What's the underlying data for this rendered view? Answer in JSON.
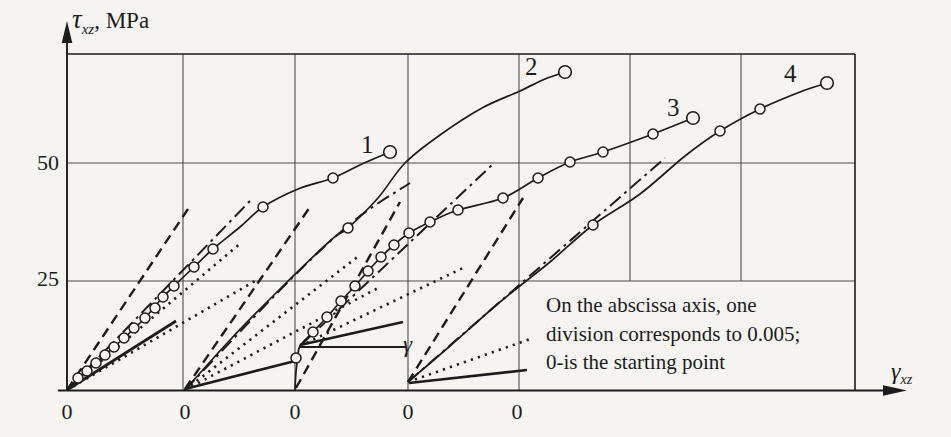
{
  "meta": {
    "bg": "#f5f4f1",
    "ink": "#1c1c1c",
    "grid_color": "#4d4d4d"
  },
  "axis": {
    "y_label": {
      "symbol": "τ",
      "sub": "xz",
      "suffix": ", MPa"
    },
    "x_label": {
      "symbol": "γ",
      "sub": "xz"
    },
    "y_ticks": [
      {
        "label": "50",
        "y": 163
      },
      {
        "label": "25",
        "y": 280
      }
    ],
    "zero_labels": [
      {
        "label": "0",
        "x": 67
      },
      {
        "label": "0",
        "x": 185
      },
      {
        "label": "0",
        "x": 295
      },
      {
        "label": "0",
        "x": 408
      },
      {
        "label": "0",
        "x": 517
      }
    ]
  },
  "frame": {
    "left": 67,
    "right": 855,
    "top": 54,
    "bottom": 390,
    "grid_vertical_full": [
      183,
      295,
      408,
      519
    ],
    "grid_vertical_partial": [
      {
        "x": 630,
        "y1": 54,
        "y2": 281
      },
      {
        "x": 741,
        "y1": 54,
        "y2": 281
      }
    ],
    "grid_horizontal": [
      163,
      281
    ],
    "x_axis_end": 886,
    "x_arrow_tip": 907,
    "y_axis_end": 40,
    "y_arrow_tip": 21
  },
  "gamma_marker": {
    "label": "γ"
  },
  "annotation": {
    "lines": [
      "On the abscissa axis, one",
      "division corresponds to 0.005;",
      "0-is the starting point"
    ]
  },
  "curve_labels": [
    {
      "text": "1",
      "x": 361,
      "y": 133
    },
    {
      "text": "2",
      "x": 525,
      "y": 55
    },
    {
      "text": "3",
      "x": 667,
      "y": 96
    },
    {
      "text": "4",
      "x": 784,
      "y": 62
    }
  ],
  "chart_data": {
    "type": "line",
    "title": "",
    "xlabel": "γxz (shear strain; one abscissa division = 0.005, each curve starts at its own 0)",
    "ylabel": "τxz, MPa",
    "ylim": [
      0,
      75
    ],
    "x_division_value": 0.005,
    "x_division_px": 112.3,
    "y_px_per_mpa": 4.52,
    "series": [
      {
        "name": "1",
        "origin_px": [
          67,
          390
        ],
        "path_px": [
          [
            67,
            390
          ],
          [
            87,
            371
          ],
          [
            105,
            355
          ],
          [
            124,
            338
          ],
          [
            145,
            318
          ],
          [
            163,
            297
          ],
          [
            174,
            286
          ],
          [
            194,
            267
          ],
          [
            213,
            249
          ],
          [
            240,
            227
          ],
          [
            263,
            207
          ],
          [
            298,
            189
          ],
          [
            333,
            178
          ],
          [
            362,
            164
          ],
          [
            390,
            152
          ]
        ],
        "markers_px": [
          [
            78,
            378
          ],
          [
            87,
            371
          ],
          [
            96,
            363
          ],
          [
            105,
            355
          ],
          [
            114,
            347
          ],
          [
            124,
            338
          ],
          [
            134,
            328
          ],
          [
            145,
            318
          ],
          [
            155,
            308
          ],
          [
            163,
            297
          ],
          [
            174,
            286
          ],
          [
            194,
            267
          ],
          [
            213,
            249
          ],
          [
            263,
            207
          ],
          [
            333,
            178
          ]
        ],
        "end_marker_px": [
          390,
          152
        ],
        "values_strain_stress": [
          [
            0,
            0
          ],
          [
            0.0009,
            4.2
          ],
          [
            0.0017,
            7.7
          ],
          [
            0.0025,
            11.5
          ],
          [
            0.0035,
            15.9
          ],
          [
            0.0043,
            20.6
          ],
          [
            0.0048,
            23.0
          ],
          [
            0.0057,
            27.2
          ],
          [
            0.0065,
            31.2
          ],
          [
            0.0077,
            36.1
          ],
          [
            0.0087,
            40.5
          ],
          [
            0.0103,
            44.5
          ],
          [
            0.0118,
            46.9
          ],
          [
            0.0131,
            50.0
          ],
          [
            0.0144,
            52.7
          ]
        ]
      },
      {
        "name": "2",
        "origin_px": [
          185,
          390
        ],
        "path_px": [
          [
            185,
            390
          ],
          [
            230,
            340
          ],
          [
            280,
            289
          ],
          [
            330,
            241
          ],
          [
            348,
            228
          ],
          [
            378,
            198
          ],
          [
            405,
            163
          ],
          [
            440,
            135
          ],
          [
            482,
            108
          ],
          [
            520,
            91
          ],
          [
            545,
            79
          ],
          [
            565,
            72
          ]
        ],
        "markers_px": [
          [
            348,
            228
          ]
        ],
        "end_marker_px": [
          565,
          72
        ],
        "values_strain_stress": [
          [
            0,
            0
          ],
          [
            0.002,
            11.1
          ],
          [
            0.0042,
            22.3
          ],
          [
            0.0065,
            33.0
          ],
          [
            0.0073,
            35.8
          ],
          [
            0.0086,
            42.5
          ],
          [
            0.0098,
            50.2
          ],
          [
            0.0114,
            56.4
          ],
          [
            0.0132,
            62.4
          ],
          [
            0.0149,
            66.2
          ],
          [
            0.016,
            68.8
          ],
          [
            0.0169,
            70.4
          ]
        ]
      },
      {
        "name": "3",
        "origin_px": [
          295,
          390
        ],
        "path_px": [
          [
            295,
            390
          ],
          [
            296,
            372
          ],
          [
            298,
            356
          ],
          [
            300,
            346
          ],
          [
            313,
            332
          ],
          [
            327,
            317
          ],
          [
            341,
            301
          ],
          [
            355,
            286
          ],
          [
            368,
            271
          ],
          [
            381,
            257
          ],
          [
            394,
            245
          ],
          [
            409,
            233
          ],
          [
            430,
            222
          ],
          [
            458,
            210
          ],
          [
            503,
            198
          ],
          [
            538,
            178
          ],
          [
            570,
            162
          ],
          [
            603,
            152
          ],
          [
            653,
            134
          ],
          [
            693,
            118
          ]
        ],
        "markers_px": [
          [
            296,
            358
          ],
          [
            313,
            332
          ],
          [
            327,
            317
          ],
          [
            341,
            301
          ],
          [
            355,
            286
          ],
          [
            368,
            271
          ],
          [
            381,
            257
          ],
          [
            394,
            245
          ],
          [
            409,
            233
          ],
          [
            430,
            222
          ],
          [
            458,
            210
          ],
          [
            503,
            198
          ],
          [
            538,
            178
          ],
          [
            570,
            162
          ],
          [
            603,
            152
          ],
          [
            653,
            134
          ]
        ],
        "end_marker_px": [
          693,
          118
        ],
        "values_strain_stress": [
          [
            0,
            0
          ],
          [
            0,
            4.0
          ],
          [
            0.0001,
            7.5
          ],
          [
            0.0002,
            9.7
          ],
          [
            0.0008,
            12.8
          ],
          [
            0.0014,
            16.2
          ],
          [
            0.002,
            19.7
          ],
          [
            0.0027,
            23.0
          ],
          [
            0.0033,
            26.3
          ],
          [
            0.0038,
            29.4
          ],
          [
            0.0044,
            32.1
          ],
          [
            0.0051,
            34.7
          ],
          [
            0.006,
            37.2
          ],
          [
            0.0073,
            39.8
          ],
          [
            0.0093,
            42.5
          ],
          [
            0.0108,
            46.9
          ],
          [
            0.0122,
            50.4
          ],
          [
            0.0137,
            52.7
          ],
          [
            0.0159,
            56.6
          ],
          [
            0.0177,
            60.2
          ]
        ]
      },
      {
        "name": "4",
        "origin_px": [
          408,
          382
        ],
        "path_px": [
          [
            408,
            382
          ],
          [
            450,
            346
          ],
          [
            500,
            302
          ],
          [
            550,
            262
          ],
          [
            593,
            225
          ],
          [
            640,
            194
          ],
          [
            685,
            156
          ],
          [
            720,
            131
          ],
          [
            760,
            109
          ],
          [
            800,
            92
          ],
          [
            827,
            83
          ]
        ],
        "markers_px": [
          [
            593,
            225
          ],
          [
            720,
            131
          ],
          [
            760,
            109
          ]
        ],
        "end_marker_px": [
          827,
          83
        ],
        "values_strain_stress": [
          [
            0,
            1.8
          ],
          [
            0.0019,
            9.7
          ],
          [
            0.0041,
            19.5
          ],
          [
            0.0063,
            28.3
          ],
          [
            0.0082,
            36.5
          ],
          [
            0.0103,
            43.4
          ],
          [
            0.0123,
            51.8
          ],
          [
            0.0139,
            57.3
          ],
          [
            0.0157,
            62.2
          ],
          [
            0.0175,
            65.9
          ],
          [
            0.0187,
            67.9
          ]
        ]
      }
    ],
    "fans": [
      {
        "origin": [
          67,
          390
        ],
        "lines": [
          {
            "style": "dashed",
            "pts": [
              [
                67,
                390
              ],
              [
                188,
                209
              ]
            ]
          },
          {
            "style": "dashdot",
            "pts": [
              [
                67,
                390
              ],
              [
                250,
                201
              ]
            ]
          },
          {
            "style": "dotted",
            "pts": [
              [
                67,
                390
              ],
              [
                242,
                242
              ]
            ]
          },
          {
            "style": "dotted",
            "pts": [
              [
                67,
                390
              ],
              [
                255,
                281
              ]
            ]
          },
          {
            "style": "solid_thick",
            "pts": [
              [
                67,
                390
              ],
              [
                176,
                321
              ]
            ]
          }
        ]
      },
      {
        "origin": [
          185,
          390
        ],
        "lines": [
          {
            "style": "dashed",
            "pts": [
              [
                185,
                389
              ],
              [
                310,
                207
              ]
            ]
          },
          {
            "style": "dashdot",
            "pts": [
              [
                185,
                390
              ],
              [
                290,
                280
              ],
              [
                355,
                220
              ],
              [
                410,
                183
              ]
            ]
          },
          {
            "style": "dotted",
            "pts": [
              [
                185,
                390
              ],
              [
                360,
                255
              ]
            ]
          },
          {
            "style": "dotted",
            "pts": [
              [
                185,
                390
              ],
              [
                378,
                288
              ]
            ]
          },
          {
            "style": "solid_thick",
            "pts": [
              [
                185,
                389
              ],
              [
                299,
                360
              ]
            ]
          }
        ]
      },
      {
        "origin": [
          295,
          390
        ],
        "lines": [
          {
            "style": "dashed",
            "pts": [
              [
                296,
                388
              ],
              [
                400,
                202
              ]
            ]
          },
          {
            "style": "dashdot",
            "pts": [
              [
                300,
                346
              ],
              [
                492,
                165
              ]
            ]
          },
          {
            "style": "dotted",
            "pts": [
              [
                300,
                346
              ],
              [
                465,
                267
              ]
            ]
          },
          {
            "style": "solid_thick",
            "pts": [
              [
                300,
                345
              ],
              [
                403,
                322
              ]
            ]
          },
          {
            "style": "solid_axis",
            "pts": [
              [
                299,
                347
              ],
              [
                406,
                347
              ]
            ]
          }
        ]
      },
      {
        "origin": [
          408,
          382
        ],
        "lines": [
          {
            "style": "dashed",
            "pts": [
              [
                408,
                382
              ],
              [
                523,
                198
              ]
            ]
          },
          {
            "style": "dashdot",
            "pts": [
              [
                408,
                382
              ],
              [
                665,
                158
              ]
            ]
          },
          {
            "style": "dotted",
            "pts": [
              [
                408,
                382
              ],
              [
                533,
                338
              ]
            ]
          },
          {
            "style": "solid_thick",
            "pts": [
              [
                409,
                383
              ],
              [
                527,
                370
              ]
            ]
          }
        ]
      }
    ]
  }
}
